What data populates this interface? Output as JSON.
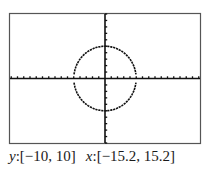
{
  "chart_data": {
    "type": "line",
    "title": "",
    "series": [
      {
        "name": "upper",
        "equation": "y = sqrt(25 - x^2)"
      },
      {
        "name": "lower",
        "equation": "y = -sqrt(25 - x^2)"
      }
    ],
    "radius": 5,
    "xlim": [
      -15.2,
      15.2
    ],
    "ylim": [
      -10,
      10
    ],
    "xscl": 1,
    "yscl": 1,
    "grid": false,
    "xlabel": "x",
    "ylabel": "y"
  },
  "window": {
    "y_label": "y",
    "y_range": ":[−10, 10]",
    "x_label": "x",
    "x_range": ":[−15.2, 15.2]"
  },
  "colors": {
    "frame": "#555555",
    "axes": "#111111",
    "curve": "#111111",
    "background": "#ffffff"
  }
}
